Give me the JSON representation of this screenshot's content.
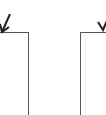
{
  "diagram": {
    "nodes": [
      {
        "id": "left-box",
        "label": "",
        "partial": true
      },
      {
        "id": "right-box",
        "label": "",
        "partial": true
      }
    ],
    "edges": [
      {
        "to": "left-box",
        "direction": "down",
        "style": "arrow"
      },
      {
        "to": "right-box",
        "direction": "down",
        "style": "arrow"
      }
    ],
    "colors": {
      "stroke": "#555555",
      "arrow": "#222222",
      "background": "#ffffff"
    }
  }
}
